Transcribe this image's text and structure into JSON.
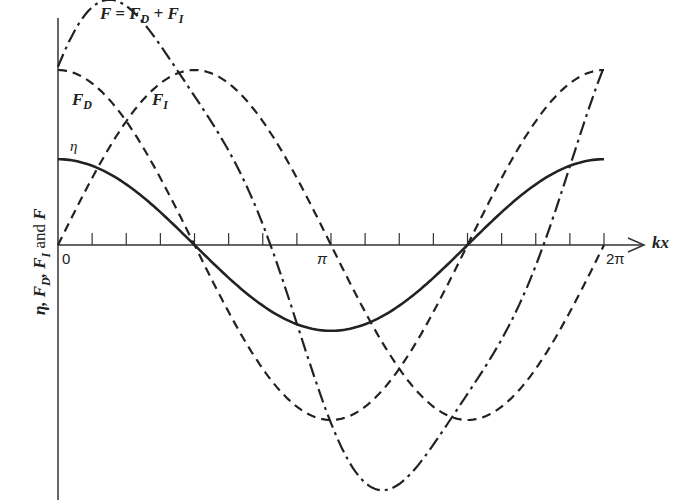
{
  "chart_data": {
    "type": "line",
    "title": "",
    "xlabel": "kx",
    "ylabel": "η, F_D, F_I and F",
    "x_ticks": [
      "0",
      "π",
      "2π"
    ],
    "x_range": [
      0,
      6.2832
    ],
    "minor_ticks_count": 16,
    "grid": false,
    "series": [
      {
        "name": "η",
        "function": "A cos(kx)",
        "amplitude": 0.49,
        "style": "solid"
      },
      {
        "name": "F_D",
        "function": "A cos(kx)",
        "amplitude": 1.0,
        "style": "dashed"
      },
      {
        "name": "F_I",
        "function": "A sin(kx)",
        "amplitude": 1.0,
        "style": "dashed"
      },
      {
        "name": "F = F_D + F_I",
        "function": "F_D + F_I",
        "amplitude": 1.3,
        "style": "dash-dot"
      }
    ],
    "annotations": [
      "F = F_D + F_I",
      "F_D",
      "F_I",
      "η"
    ]
  },
  "labels": {
    "f_total": "F = F_D + F_I",
    "f_d": "F_D",
    "f_i": "F_I",
    "eta": "η",
    "xaxis": "kx",
    "yaxis": "η, F_D, F_I and F",
    "tick0": "0",
    "tickpi": "π",
    "tick2pi": "2π"
  }
}
